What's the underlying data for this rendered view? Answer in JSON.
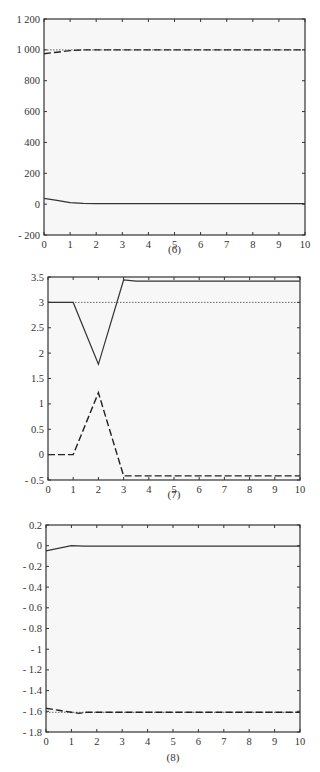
{
  "chart_data": [
    {
      "type": "line",
      "caption": "(6)",
      "title": "",
      "xlabel": "",
      "ylabel": "",
      "xlim": [
        0,
        10
      ],
      "ylim": [
        -200,
        1200
      ],
      "xticks": [
        0,
        1,
        2,
        3,
        4,
        5,
        6,
        7,
        8,
        9,
        10
      ],
      "yticks": [
        -200,
        0,
        200,
        400,
        600,
        800,
        1000,
        1200
      ],
      "ytick_labels": [
        "- 200",
        "0",
        "200",
        "400",
        "600",
        "800",
        "1 000",
        "1 200"
      ],
      "grid": false,
      "legend": null,
      "series": [
        {
          "name": "reference",
          "style": "dotted",
          "x": [
            0,
            10
          ],
          "y": [
            1000,
            1000
          ]
        },
        {
          "name": "response-dashed",
          "style": "dashed",
          "x": [
            0,
            0.5,
            1,
            1.5,
            2,
            10
          ],
          "y": [
            975,
            985,
            995,
            1000,
            1000,
            1000
          ]
        },
        {
          "name": "response-solid",
          "style": "solid",
          "x": [
            0,
            0.5,
            1,
            1.5,
            2,
            10
          ],
          "y": [
            38,
            25,
            10,
            5,
            3,
            3
          ]
        }
      ]
    },
    {
      "type": "line",
      "caption": "(7)",
      "title": "",
      "xlabel": "",
      "ylabel": "",
      "xlim": [
        0,
        10
      ],
      "ylim": [
        -0.5,
        3.5
      ],
      "xticks": [
        0,
        1,
        2,
        3,
        4,
        5,
        6,
        7,
        8,
        9,
        10
      ],
      "yticks": [
        -0.5,
        0,
        0.5,
        1,
        1.5,
        2,
        2.5,
        3,
        3.5
      ],
      "ytick_labels": [
        "- 0.5",
        "0",
        "0.5",
        "1",
        "1.5",
        "2",
        "2.5",
        "3",
        "3.5"
      ],
      "grid": false,
      "legend": null,
      "series": [
        {
          "name": "reference",
          "style": "dotted",
          "x": [
            0,
            10
          ],
          "y": [
            3,
            3
          ]
        },
        {
          "name": "response-solid",
          "style": "solid",
          "x": [
            0,
            1,
            2,
            3,
            3.5,
            10
          ],
          "y": [
            3,
            3,
            1.78,
            3.44,
            3.42,
            3.42
          ]
        },
        {
          "name": "response-dashed",
          "style": "dashed",
          "x": [
            0,
            1,
            2,
            3,
            10
          ],
          "y": [
            0,
            0,
            1.22,
            -0.42,
            -0.42
          ]
        }
      ]
    },
    {
      "type": "line",
      "caption": "(8)",
      "title": "",
      "xlabel": "",
      "ylabel": "",
      "xlim": [
        0,
        10
      ],
      "ylim": [
        -1.8,
        0.2
      ],
      "xticks": [
        0,
        1,
        2,
        3,
        4,
        5,
        6,
        7,
        8,
        9,
        10
      ],
      "yticks": [
        -1.8,
        -1.6,
        -1.4,
        -1.2,
        -1,
        -0.8,
        -0.6,
        -0.4,
        -0.2,
        0,
        0.2
      ],
      "ytick_labels": [
        "- 1.8",
        "- 1.6",
        "- 1.4",
        "- 1.2",
        "- 1",
        "- 0.8",
        "- 0.6",
        "- 0.4",
        "- 0.2",
        "0",
        "0.2"
      ],
      "grid": false,
      "legend": null,
      "series": [
        {
          "name": "reference",
          "style": "dotted",
          "x": [
            0,
            10
          ],
          "y": [
            -1.61,
            -1.61
          ]
        },
        {
          "name": "response-solid",
          "style": "solid",
          "x": [
            0,
            1,
            1.5,
            10
          ],
          "y": [
            -0.05,
            0.0,
            -0.005,
            -0.005
          ]
        },
        {
          "name": "response-dashed",
          "style": "dashed",
          "x": [
            0,
            0.5,
            1,
            1.3,
            1.6,
            10
          ],
          "y": [
            -1.57,
            -1.59,
            -1.61,
            -1.62,
            -1.61,
            -1.61
          ]
        }
      ]
    }
  ]
}
